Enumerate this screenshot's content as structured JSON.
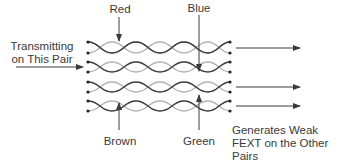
{
  "diagram": {
    "type": "twisted-pair-fext",
    "colors": {
      "dark_wire": "#3c3c3c",
      "light_wire": "#b4b4b4",
      "arrow": "#3a3a3a",
      "text": "#3a3a3a"
    },
    "labels": {
      "red": "Red",
      "blue": "Blue",
      "brown": "Brown",
      "green": "Green",
      "transmit_line1": "Transmitting",
      "transmit_line2": "on This Pair",
      "fext_line1": "Generates Weak",
      "fext_line2": "FEXT on the Other",
      "fext_line3": "Pairs"
    },
    "pairs": [
      {
        "name": "Red",
        "role": "victim",
        "output_arrow": true
      },
      {
        "name": "Blue",
        "role": "transmitting",
        "output_arrow": false
      },
      {
        "name": "Green",
        "role": "victim",
        "output_arrow": true
      },
      {
        "name": "Brown",
        "role": "victim",
        "output_arrow": true
      }
    ]
  }
}
